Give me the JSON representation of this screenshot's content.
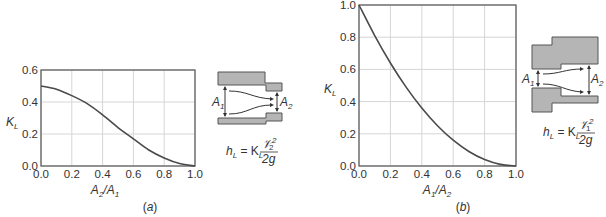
{
  "chart_data": [
    {
      "type": "line",
      "panel": "(a)",
      "title": "",
      "xlabel": "A2/A1",
      "ylabel": "KL",
      "xlim": [
        0,
        1
      ],
      "ylim": [
        0,
        0.6
      ],
      "xticks": [
        "0.0",
        "0.2",
        "0.4",
        "0.6",
        "0.8",
        "1.0"
      ],
      "yticks": [
        "0.0",
        "0.2",
        "0.4",
        "0.6"
      ],
      "grid": true,
      "x": [
        0.0,
        0.1,
        0.2,
        0.3,
        0.4,
        0.5,
        0.6,
        0.7,
        0.8,
        0.9,
        1.0
      ],
      "series": [
        {
          "name": "KL (sudden contraction)",
          "values": [
            0.5,
            0.48,
            0.44,
            0.39,
            0.32,
            0.24,
            0.17,
            0.1,
            0.05,
            0.015,
            0.0
          ]
        }
      ],
      "formula": "hL = KL V2²/2g",
      "diagram": "sudden contraction A1 → A2",
      "caption": "(a)"
    },
    {
      "type": "line",
      "panel": "(b)",
      "title": "",
      "xlabel": "A1/A2",
      "ylabel": "KL",
      "xlim": [
        0,
        1
      ],
      "ylim": [
        0,
        1.0
      ],
      "xticks": [
        "0.0",
        "0.2",
        "0.4",
        "0.6",
        "0.8",
        "1.0"
      ],
      "yticks": [
        "0.0",
        "0.2",
        "0.4",
        "0.6",
        "0.8",
        "1.0"
      ],
      "grid": true,
      "x": [
        0.0,
        0.1,
        0.2,
        0.3,
        0.4,
        0.5,
        0.6,
        0.7,
        0.8,
        0.9,
        1.0
      ],
      "series": [
        {
          "name": "KL (sudden expansion)",
          "values": [
            1.0,
            0.81,
            0.64,
            0.49,
            0.36,
            0.25,
            0.16,
            0.09,
            0.04,
            0.01,
            0.0
          ]
        }
      ],
      "formula": "hL = KL V1²/2g",
      "diagram": "sudden expansion A1 → A2",
      "caption": "(b)"
    }
  ],
  "labels": {
    "a": {
      "ylabel": "K",
      "ylabel_sub": "L",
      "xlabel_num": "A",
      "xlabel_num_sub": "2",
      "xlabel_den": "A",
      "xlabel_den_sub": "1",
      "caption": "(a)",
      "area1": "A",
      "area1_sub": "1",
      "area2": "A",
      "area2_sub": "2",
      "formula_lhs": "h",
      "formula_lhs_sub": "L",
      "formula_eq": " = K",
      "formula_k_sub": "L",
      "formula_num": "𝒱",
      "formula_num_sup": "2",
      "formula_num_sub": "2",
      "formula_den": "2g"
    },
    "b": {
      "ylabel": "K",
      "ylabel_sub": "L",
      "xlabel_num": "A",
      "xlabel_num_sub": "1",
      "xlabel_den": "A",
      "xlabel_den_sub": "2",
      "caption": "(b)",
      "area1": "A",
      "area1_sub": "1",
      "area2": "A",
      "area2_sub": "2",
      "formula_lhs": "h",
      "formula_lhs_sub": "L",
      "formula_eq": " = K",
      "formula_k_sub": "L",
      "formula_num": "𝒱",
      "formula_num_sup": "2",
      "formula_num_sub": "1",
      "formula_den": "2g"
    }
  }
}
